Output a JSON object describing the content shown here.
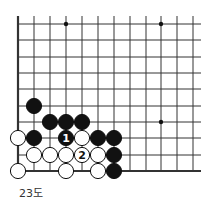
{
  "diagram": {
    "caption": "23도",
    "grid": {
      "columns_x": [
        18,
        34,
        50,
        66,
        82,
        98,
        114,
        130,
        146,
        161,
        177,
        193
      ],
      "rows_y": [
        24,
        40,
        57,
        73,
        89,
        106,
        122,
        138,
        155,
        171
      ],
      "right_extent": 201,
      "top_extent": 16,
      "line_color": "#333333",
      "edge_width": 2.2
    },
    "star_points": [
      {
        "col": 3,
        "row": 0
      },
      {
        "col": 9,
        "row": 0
      },
      {
        "col": 9,
        "row": 6
      }
    ],
    "stones": [
      {
        "color": "black",
        "col": 1,
        "row": 5,
        "label": ""
      },
      {
        "color": "black",
        "col": 2,
        "row": 6,
        "label": ""
      },
      {
        "color": "black",
        "col": 3,
        "row": 6,
        "label": ""
      },
      {
        "color": "black",
        "col": 4,
        "row": 6,
        "label": ""
      },
      {
        "color": "white",
        "col": 0,
        "row": 7,
        "label": ""
      },
      {
        "color": "black",
        "col": 1,
        "row": 7,
        "label": ""
      },
      {
        "color": "black",
        "col": 3,
        "row": 7,
        "label": "1"
      },
      {
        "color": "white",
        "col": 4,
        "row": 7,
        "label": ""
      },
      {
        "color": "black",
        "col": 5,
        "row": 7,
        "label": ""
      },
      {
        "color": "black",
        "col": 6,
        "row": 7,
        "label": ""
      },
      {
        "color": "white",
        "col": 1,
        "row": 8,
        "label": ""
      },
      {
        "color": "white",
        "col": 2,
        "row": 8,
        "label": ""
      },
      {
        "color": "white",
        "col": 3,
        "row": 8,
        "label": ""
      },
      {
        "color": "white",
        "col": 4,
        "row": 8,
        "label": "2"
      },
      {
        "color": "white",
        "col": 5,
        "row": 8,
        "label": ""
      },
      {
        "color": "black",
        "col": 6,
        "row": 8,
        "label": ""
      },
      {
        "color": "white",
        "col": 0,
        "row": 9,
        "label": ""
      },
      {
        "color": "white",
        "col": 3,
        "row": 9,
        "label": ""
      },
      {
        "color": "white",
        "col": 5,
        "row": 9,
        "label": ""
      },
      {
        "color": "black",
        "col": 6,
        "row": 9,
        "label": ""
      }
    ]
  }
}
